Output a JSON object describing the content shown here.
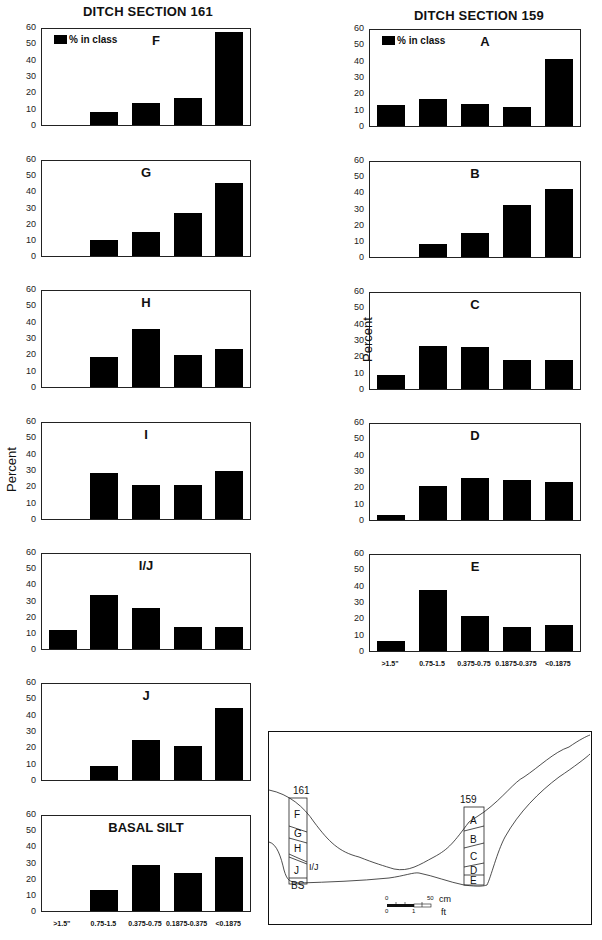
{
  "columns": {
    "left_title": "DITCH SECTION 161",
    "right_title": "DITCH SECTION 159"
  },
  "legend": {
    "label": "% in class"
  },
  "y_axis_label": "Percent",
  "y_ticks": [
    "60",
    "50",
    "40",
    "30",
    "20",
    "10",
    "0"
  ],
  "x_categories": [
    ">1.5\"",
    "0.75-1.5",
    "0.375-0.75",
    "0.1875-0.375",
    "<0.1875"
  ],
  "diagram": {
    "section_left_label": "161",
    "section_right_label": "159",
    "left_layers": [
      "F",
      "G",
      "H",
      "I/J",
      "J",
      "BS"
    ],
    "right_layers": [
      "A",
      "B",
      "C",
      "D",
      "E"
    ],
    "scale_cm_zero": "0",
    "scale_cm_max": "50",
    "scale_cm_unit": "cm",
    "scale_ft_zero": "0",
    "scale_ft_one": "1",
    "scale_ft_unit": "ft"
  },
  "chart_data": [
    {
      "type": "bar",
      "section": "161",
      "title": "F",
      "categories": [
        ">1.5\"",
        "0.75-1.5",
        "0.375-0.75",
        "0.1875-0.375",
        "<0.1875"
      ],
      "values": [
        0,
        8,
        14,
        17,
        58
      ],
      "ylabel": "Percent",
      "ylim": [
        0,
        60
      ],
      "legend": [
        "% in class"
      ]
    },
    {
      "type": "bar",
      "section": "161",
      "title": "G",
      "categories": [
        ">1.5\"",
        "0.75-1.5",
        "0.375-0.75",
        "0.1875-0.375",
        "<0.1875"
      ],
      "values": [
        0,
        10,
        15,
        27,
        46
      ],
      "ylabel": "Percent",
      "ylim": [
        0,
        60
      ]
    },
    {
      "type": "bar",
      "section": "161",
      "title": "H",
      "categories": [
        ">1.5\"",
        "0.75-1.5",
        "0.375-0.75",
        "0.1875-0.375",
        "<0.1875"
      ],
      "values": [
        0,
        19,
        36,
        20,
        24
      ],
      "ylabel": "Percent",
      "ylim": [
        0,
        60
      ]
    },
    {
      "type": "bar",
      "section": "161",
      "title": "I",
      "categories": [
        ">1.5\"",
        "0.75-1.5",
        "0.375-0.75",
        "0.1875-0.375",
        "<0.1875"
      ],
      "values": [
        0,
        29,
        21,
        21,
        30
      ],
      "ylabel": "Percent",
      "ylim": [
        0,
        60
      ]
    },
    {
      "type": "bar",
      "section": "161",
      "title": "I/J",
      "categories": [
        ">1.5\"",
        "0.75-1.5",
        "0.375-0.75",
        "0.1875-0.375",
        "<0.1875"
      ],
      "values": [
        12,
        34,
        26,
        14,
        14
      ],
      "ylabel": "Percent",
      "ylim": [
        0,
        60
      ]
    },
    {
      "type": "bar",
      "section": "161",
      "title": "J",
      "categories": [
        ">1.5\"",
        "0.75-1.5",
        "0.375-0.75",
        "0.1875-0.375",
        "<0.1875"
      ],
      "values": [
        0,
        9,
        25,
        21,
        45
      ],
      "ylabel": "Percent",
      "ylim": [
        0,
        60
      ]
    },
    {
      "type": "bar",
      "section": "161",
      "title": "BASAL SILT",
      "categories": [
        ">1.5\"",
        "0.75-1.5",
        "0.375-0.75",
        "0.1875-0.375",
        "<0.1875"
      ],
      "values": [
        0,
        13,
        29,
        24,
        34
      ],
      "ylabel": "Percent",
      "ylim": [
        0,
        60
      ]
    },
    {
      "type": "bar",
      "section": "159",
      "title": "A",
      "categories": [
        ">1.5\"",
        "0.75-1.5",
        "0.375-0.75",
        "0.1875-0.375",
        "<0.1875"
      ],
      "values": [
        13,
        17,
        14,
        12,
        42
      ],
      "ylabel": "Percent",
      "ylim": [
        0,
        60
      ],
      "legend": [
        "% in class"
      ]
    },
    {
      "type": "bar",
      "section": "159",
      "title": "B",
      "categories": [
        ">1.5\"",
        "0.75-1.5",
        "0.375-0.75",
        "0.1875-0.375",
        "<0.1875"
      ],
      "values": [
        0,
        8,
        15,
        33,
        43
      ],
      "ylabel": "Percent",
      "ylim": [
        0,
        60
      ]
    },
    {
      "type": "bar",
      "section": "159",
      "title": "C",
      "categories": [
        ">1.5\"",
        "0.75-1.5",
        "0.375-0.75",
        "0.1875-0.375",
        "<0.1875"
      ],
      "values": [
        9,
        27,
        26,
        18,
        18
      ],
      "ylabel": "Percent",
      "ylim": [
        0,
        60
      ]
    },
    {
      "type": "bar",
      "section": "159",
      "title": "D",
      "categories": [
        ">1.5\"",
        "0.75-1.5",
        "0.375-0.75",
        "0.1875-0.375",
        "<0.1875"
      ],
      "values": [
        3,
        21,
        26,
        25,
        24
      ],
      "ylabel": "Percent",
      "ylim": [
        0,
        60
      ]
    },
    {
      "type": "bar",
      "section": "159",
      "title": "E",
      "categories": [
        ">1.5\"",
        "0.75-1.5",
        "0.375-0.75",
        "0.1875-0.375",
        "<0.1875"
      ],
      "values": [
        6,
        38,
        22,
        15,
        16
      ],
      "ylabel": "Percent",
      "ylim": [
        0,
        60
      ]
    }
  ]
}
